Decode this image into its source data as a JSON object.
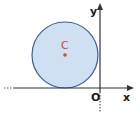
{
  "diagram": {
    "type": "coordinate-plane-circle",
    "axes": {
      "x_label": "x",
      "y_label": "y",
      "origin_label": "O"
    },
    "circle": {
      "center_label": "C",
      "fill_color": "#cfe0f3",
      "stroke_color": "#3a5f9a",
      "center_dot_color": "#d9452f",
      "tangent_to": "x-axis"
    },
    "colors": {
      "axis": "#333333",
      "label": "#1a1a1a"
    }
  }
}
